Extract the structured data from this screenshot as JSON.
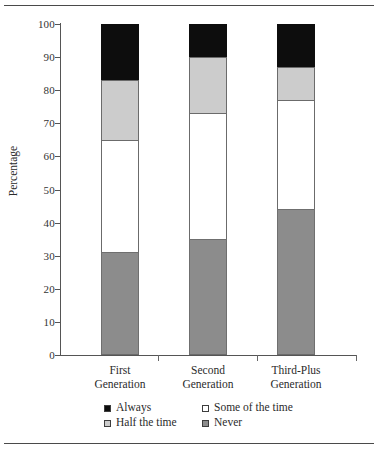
{
  "chart_data": {
    "type": "bar",
    "subtype": "stacked-bar-100",
    "title": "",
    "xlabel": "",
    "ylabel": "Percentage",
    "ylim": [
      0,
      100
    ],
    "ytick_labels": [
      "100",
      "90",
      "80",
      "70",
      "60",
      "50",
      "40",
      "30",
      "20",
      "10",
      "0"
    ],
    "ytick_values": [
      100,
      90,
      80,
      70,
      60,
      50,
      40,
      30,
      20,
      10,
      0
    ],
    "grid": false,
    "legend_position": "bottom",
    "categories": [
      "First Generation",
      "Second Generation",
      "Third-Plus Generation"
    ],
    "category_lines": [
      [
        "First",
        "Generation"
      ],
      [
        "Second",
        "Generation"
      ],
      [
        "Third-Plus",
        "Generation"
      ]
    ],
    "series": [
      {
        "name": "Always",
        "color": "#0d0d0d",
        "values": [
          17,
          10,
          13
        ]
      },
      {
        "name": "Half the time",
        "color": "#cccccc",
        "values": [
          18,
          17,
          10
        ]
      },
      {
        "name": "Some of the time",
        "color": "#ffffff",
        "values": [
          34,
          38,
          33
        ]
      },
      {
        "name": "Never",
        "color": "#8c8c8c",
        "values": [
          31,
          35,
          44
        ]
      }
    ],
    "stack_tops": {
      "Never": [
        31,
        35,
        44
      ],
      "Some of the time": [
        65,
        73,
        77
      ],
      "Half the time": [
        83,
        90,
        87
      ],
      "Always": [
        100,
        100,
        100
      ]
    },
    "legend_entries": [
      {
        "label": "Always",
        "color": "#0d0d0d"
      },
      {
        "label": "Some of the time",
        "color": "#ffffff"
      },
      {
        "label": "Half the time",
        "color": "#cccccc"
      },
      {
        "label": "Never",
        "color": "#8c8c8c"
      }
    ]
  }
}
